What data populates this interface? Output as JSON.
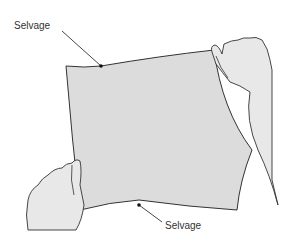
{
  "figure": {
    "labels": {
      "top": "Selvage",
      "bottom": "Selvage"
    },
    "colors": {
      "fabric": "#dcdcdc",
      "outline": "#333333",
      "hand": "#e8e8e8",
      "background": "#ffffff"
    }
  }
}
